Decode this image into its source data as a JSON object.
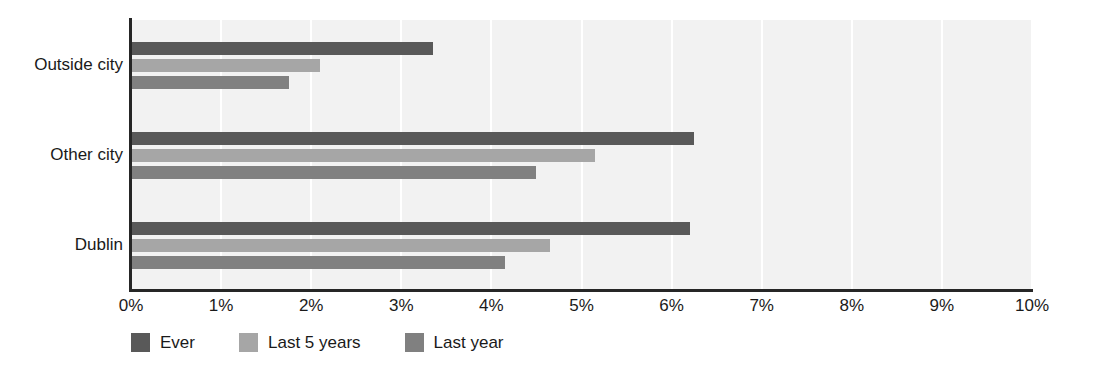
{
  "chart_data": {
    "type": "bar",
    "orientation": "horizontal",
    "title": "",
    "subtitle": "",
    "xlabel": "",
    "ylabel": "",
    "categories": [
      "Outside city",
      "Other city",
      "Dublin"
    ],
    "series": [
      {
        "name": "Ever",
        "color": "#595959",
        "values": [
          3.35,
          6.25,
          6.2
        ]
      },
      {
        "name": "Last 5 years",
        "color": "#a6a6a6",
        "values": [
          2.1,
          5.15,
          4.65
        ]
      },
      {
        "name": "Last year",
        "color": "#808080",
        "values": [
          1.75,
          4.5,
          4.15
        ]
      }
    ],
    "xlim": [
      0,
      10
    ],
    "xticks": [
      0,
      1,
      2,
      3,
      4,
      5,
      6,
      7,
      8,
      9,
      10
    ],
    "xticklabels": [
      "0%",
      "1%",
      "2%",
      "3%",
      "4%",
      "5%",
      "6%",
      "7%",
      "8%",
      "9%",
      "10%"
    ],
    "value_format": "percent",
    "grid": "vertical",
    "legend_position": "bottom-left",
    "plot_background": "#f2f2f2",
    "gridline_color": "#ffffff",
    "axis_color": "#262626"
  }
}
